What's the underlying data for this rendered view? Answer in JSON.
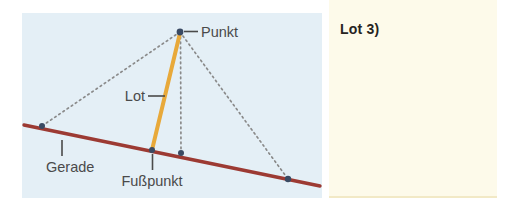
{
  "figure": {
    "panel_bg": "#e4eff6",
    "line_color": "#9c3a33",
    "perpendicular_color": "#e8a93a",
    "dotted_color": "#8a8a8a",
    "point_color": "#3a4a63",
    "label_color": "#4a4a4a",
    "labels": {
      "punkt": "Punkt",
      "lot": "Lot",
      "gerade": "Gerade",
      "fusspunkt": "Fußpunkt"
    }
  },
  "note": {
    "bg": "#fdfaea",
    "title": "Lot 3)",
    "title_color": "#262321"
  },
  "geometry": {
    "punkt": [
      180,
      32
    ],
    "fusspunkt": [
      152,
      150
    ],
    "gerade_start": [
      24,
      125
    ],
    "gerade_end": [
      320,
      186
    ],
    "dot_left": [
      42,
      126
    ],
    "dot_below_punkt": [
      181,
      153
    ],
    "dot_right": [
      288,
      179
    ]
  }
}
